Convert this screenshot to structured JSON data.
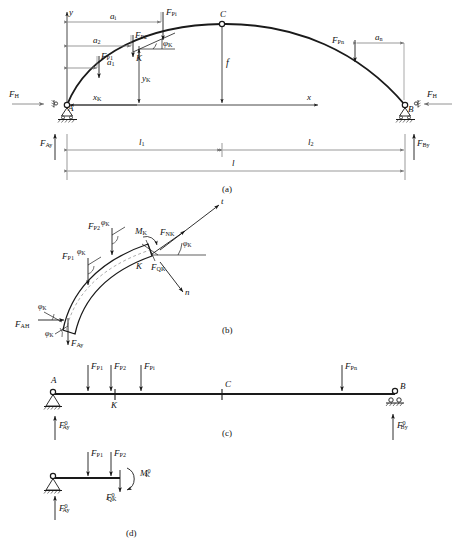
{
  "figure": {
    "stroke_color": "#1a1a1a",
    "dim_color": "#777777",
    "panels": [
      {
        "id": "a",
        "caption": "(a)",
        "description": "Three-hinged arch ABС with vertical loads, thrust and span dimensions"
      },
      {
        "id": "b",
        "caption": "(b)",
        "description": "Free body of arch segment A–K showing M_K, F_NK, F_QK with tangent t and normal n axes"
      },
      {
        "id": "c",
        "caption": "(c)",
        "description": "Equivalent simply supported reference beam with the same loads"
      },
      {
        "id": "d",
        "caption": "(d)",
        "description": "Cut segment of reference beam left of K showing M0_K and F0_QK"
      }
    ]
  },
  "panel_a": {
    "caption": "(a)",
    "axes": {
      "y_axis": "y",
      "x_axis": "x"
    },
    "nodes": {
      "left_support": "A",
      "right_support": "B",
      "crown": "C",
      "section": "K"
    },
    "loads": [
      {
        "name": "F_P1",
        "label_main": "F",
        "label_sub": "P1"
      },
      {
        "name": "F_P2",
        "label_main": "F",
        "label_sub": "P2"
      },
      {
        "name": "F_Pi",
        "label_main": "F",
        "label_sub": "Pi"
      },
      {
        "name": "F_Pn",
        "label_main": "F",
        "label_sub": "Pn"
      },
      {
        "name": "F_C",
        "label_main": "",
        "label_sub": ""
      }
    ],
    "distances": [
      {
        "name": "a_1",
        "label_main": "a",
        "label_sub": "1"
      },
      {
        "name": "a_2",
        "label_main": "a",
        "label_sub": "2"
      },
      {
        "name": "a_i",
        "label_main": "a",
        "label_sub": "i"
      },
      {
        "name": "a_n",
        "label_main": "a",
        "label_sub": "n"
      }
    ],
    "thrust_left": {
      "label_main": "F",
      "label_sub": "H"
    },
    "thrust_right": {
      "label_main": "F",
      "label_sub": "H"
    },
    "reaction_left": {
      "label_main": "F",
      "label_sub": "Ay"
    },
    "reaction_right": {
      "label_main": "F",
      "label_sub": "By"
    },
    "rise": "f",
    "section_ordinate": {
      "label_main": "y",
      "label_sub": "K"
    },
    "section_abscissa": {
      "label_main": "x",
      "label_sub": "K"
    },
    "tangent_angle": {
      "label_main": "φ",
      "label_sub": "K"
    },
    "spans": [
      {
        "name": "l_1",
        "label_main": "l",
        "label_sub": "1"
      },
      {
        "name": "l_2",
        "label_main": "l",
        "label_sub": "2"
      },
      {
        "name": "l",
        "label_main": "l",
        "label_sub": ""
      }
    ]
  },
  "panel_b": {
    "caption": "(b)",
    "section_point": "K",
    "loads": [
      {
        "name": "F_P1",
        "label_main": "F",
        "label_sub": "P1"
      },
      {
        "name": "F_P2",
        "label_main": "F",
        "label_sub": "P2"
      }
    ],
    "internal_forces": [
      {
        "name": "M_K",
        "label_main": "M",
        "label_sub": "K"
      },
      {
        "name": "F_NK",
        "label_main": "F",
        "label_sub": "NK"
      },
      {
        "name": "F_QK",
        "label_main": "F",
        "label_sub": "QK"
      }
    ],
    "support_forces": [
      {
        "name": "F_AH",
        "label_main": "F",
        "label_sub": "AH"
      },
      {
        "name": "F_Ay",
        "label_main": "F",
        "label_sub": "Ay"
      }
    ],
    "angles": [
      {
        "name": "phi_K_load1",
        "label_main": "φ",
        "label_sub": "K"
      },
      {
        "name": "phi_K_load2",
        "label_main": "φ",
        "label_sub": "K"
      },
      {
        "name": "phi_K_section",
        "label_main": "φ",
        "label_sub": "K"
      },
      {
        "name": "phi_K_AH",
        "label_main": "φ",
        "label_sub": "K"
      },
      {
        "name": "phi_K_Ay",
        "label_main": "φ",
        "label_sub": "K"
      }
    ],
    "axes": {
      "tangent": "t",
      "normal": "n"
    }
  },
  "panel_c": {
    "caption": "(c)",
    "nodes": {
      "left_support": "A",
      "right_support": "B",
      "midpoint": "C",
      "section": "K"
    },
    "loads": [
      {
        "name": "F_P1",
        "label_main": "F",
        "label_sub": "P1"
      },
      {
        "name": "F_P2",
        "label_main": "F",
        "label_sub": "P2"
      },
      {
        "name": "F_Pi",
        "label_main": "F",
        "label_sub": "Pi"
      },
      {
        "name": "F_Pn",
        "label_main": "F",
        "label_sub": "Pn"
      }
    ],
    "reactions": [
      {
        "name": "F0_Ay",
        "label_main": "F",
        "label_sub": "Ay",
        "label_sup": "0"
      },
      {
        "name": "F0_By",
        "label_main": "F",
        "label_sub": "By",
        "label_sup": "0"
      }
    ]
  },
  "panel_d": {
    "caption": "(d)",
    "loads": [
      {
        "name": "F_P1",
        "label_main": "F",
        "label_sub": "P1"
      },
      {
        "name": "F_P2",
        "label_main": "F",
        "label_sub": "P2"
      }
    ],
    "internal_forces": [
      {
        "name": "M0_K",
        "label_main": "M",
        "label_sub": "K",
        "label_sup": "0"
      },
      {
        "name": "F0_QK",
        "label_main": "F",
        "label_sub": "QK",
        "label_sup": "0"
      }
    ],
    "reactions": [
      {
        "name": "F0_Ay",
        "label_main": "F",
        "label_sub": "Ay",
        "label_sup": "0"
      }
    ]
  }
}
